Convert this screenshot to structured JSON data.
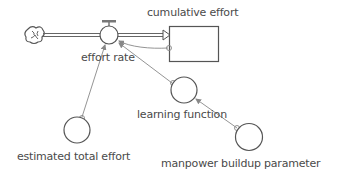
{
  "diagram": {
    "type": "stock-and-flow",
    "colors": {
      "stroke": "#555555",
      "link": "#888888",
      "text": "#4a4a4a",
      "background": "#ffffff"
    },
    "source": {
      "name": "cloud-source",
      "icon": "cloud-icon"
    },
    "flow": {
      "label": "effort rate"
    },
    "stock": {
      "label": "cumulative effort"
    },
    "auxiliaries": [
      {
        "id": "learning_function",
        "label": "learning function"
      },
      {
        "id": "estimated_total_effort",
        "label": "estimated total effort"
      },
      {
        "id": "manpower_buildup_parameter",
        "label": "manpower buildup parameter"
      }
    ],
    "links": [
      {
        "from": "cumulative effort",
        "to": "effort rate"
      },
      {
        "from": "learning function",
        "to": "effort rate"
      },
      {
        "from": "estimated total effort",
        "to": "effort rate"
      },
      {
        "from": "manpower buildup parameter",
        "to": "learning function"
      }
    ]
  }
}
